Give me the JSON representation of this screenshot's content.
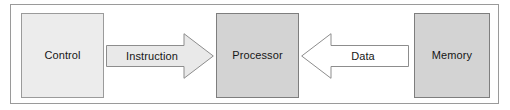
{
  "diagram": {
    "type": "block-diagram",
    "frame": {
      "border_color": "#9a9a9a",
      "background_color": "#ffffff"
    },
    "nodes": [
      {
        "id": "control",
        "label": "Control",
        "shape": "rectangle",
        "fill_color": "#ececec",
        "border_color": "#9b9b9b"
      },
      {
        "id": "processor",
        "label": "Processor",
        "shape": "rectangle",
        "fill_color": "#d3d3d3",
        "border_color": "#7e7e7e"
      },
      {
        "id": "memory",
        "label": "Memory",
        "shape": "rectangle",
        "fill_color": "#d3d3d3",
        "border_color": "#7e7e7e"
      }
    ],
    "arrows": [
      {
        "id": "instruction",
        "label": "Instruction",
        "direction": "right",
        "from": "Control",
        "to": "Processor",
        "fill_color": "#e9e9e9",
        "border_color": "#8d8d8d"
      },
      {
        "id": "data",
        "label": "Data",
        "direction": "left",
        "from": "Memory",
        "to": "Processor",
        "fill_color": "#ffffff",
        "border_color": "#8d8d8d"
      }
    ]
  }
}
